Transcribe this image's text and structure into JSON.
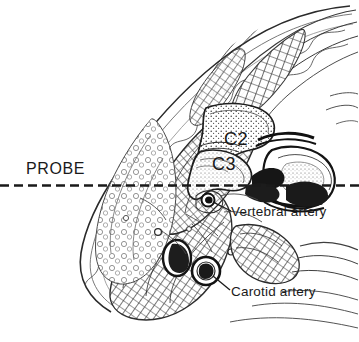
{
  "figure": {
    "kind": "anatomical-cross-section",
    "region": "cervical neck transverse section",
    "background_color": "#ffffff",
    "ink_color": "#1a1a1a",
    "width": 359,
    "height": 342
  },
  "labels": {
    "probe": "PROBE",
    "c2": "C2",
    "c3": "C3",
    "vertebral_artery": "Vertebral artery",
    "carotid_artery": "Carotid artery"
  },
  "annotations": {
    "probe_line": {
      "style": "dashed",
      "orientation": "horizontal",
      "y": 185,
      "x_start": 0,
      "x_end": 359
    },
    "leader_vertebral": {
      "from_x": 232,
      "from_y": 212,
      "to_x": 208,
      "to_y": 200,
      "marker": "filled-dot"
    },
    "leader_carotid": {
      "from_x": 231,
      "from_y": 291,
      "to_x": 208,
      "to_y": 272,
      "marker": "line"
    }
  },
  "structures": [
    {
      "name": "C2 vertebral body",
      "label": "C2"
    },
    {
      "name": "C3 vertebral body",
      "label": "C3"
    },
    {
      "name": "vertebral artery",
      "label": "Vertebral artery"
    },
    {
      "name": "carotid artery",
      "label": "Carotid artery"
    },
    {
      "name": "internal jugular vein",
      "label": ""
    },
    {
      "name": "sternocleidomastoid muscle",
      "label": ""
    },
    {
      "name": "paraspinal muscle mass",
      "label": ""
    },
    {
      "name": "spinal canal",
      "label": ""
    }
  ]
}
